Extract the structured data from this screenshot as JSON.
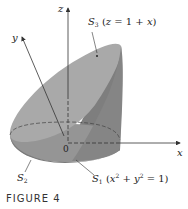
{
  "figure": {
    "caption": "FIGURE 4",
    "axes": {
      "x": "x",
      "y": "y",
      "z": "z",
      "origin": "0"
    },
    "surfaces": {
      "S3": {
        "name": "S",
        "sub": "3",
        "equation_open": "(",
        "eq_var": "z",
        "eq_rest": " = 1 + ",
        "eq_var2": "x",
        "equation_close": ")"
      },
      "S1": {
        "name": "S",
        "sub": "1",
        "equation_open": "(",
        "eq_a": "x",
        "eq_sup1": "2",
        "eq_mid": " + ",
        "eq_b": "y",
        "eq_sup2": "2",
        "eq_end": " = 1)"
      },
      "S2": {
        "name": "S",
        "sub": "2"
      }
    },
    "colors": {
      "top_surface": "#a6a6a6",
      "side_surface": "#8c8c8c",
      "bottom_surface": "#9a9a9a",
      "axis": "#333333"
    }
  }
}
